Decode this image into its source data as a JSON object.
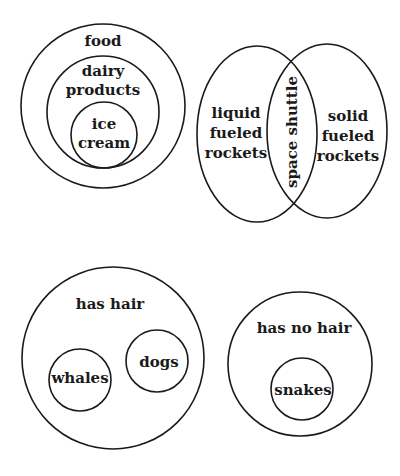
{
  "diagrams": {
    "food": {
      "outer": {
        "label": "food"
      },
      "middle": {
        "label_line1": "dairy",
        "label_line2": "products"
      },
      "inner": {
        "label_line1": "ice",
        "label_line2": "cream"
      }
    },
    "rockets": {
      "left": {
        "label_line1": "liquid",
        "label_line2": "fueled",
        "label_line3": "rockets"
      },
      "overlap": {
        "label": "space shuttle"
      },
      "right": {
        "label_line1": "solid",
        "label_line2": "fueled",
        "label_line3": "rockets"
      }
    },
    "hair": {
      "outer": {
        "label": "has hair"
      },
      "child_a": {
        "label": "whales"
      },
      "child_b": {
        "label": "dogs"
      }
    },
    "no_hair": {
      "outer": {
        "label": "has no hair"
      },
      "child": {
        "label": "snakes"
      }
    }
  },
  "colors": {
    "stroke": "#1a1a1a",
    "background": "#ffffff"
  }
}
